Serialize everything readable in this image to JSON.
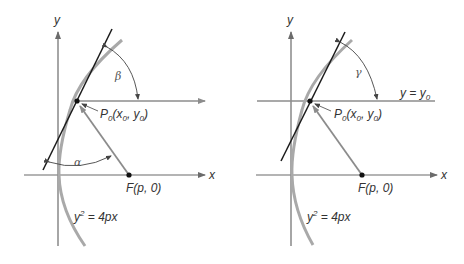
{
  "figure": {
    "left": {
      "axis_x_label": "x",
      "axis_y_label": "y",
      "point_label": {
        "P": "P",
        "sub0": "0",
        "open": "(",
        "x": "x",
        "comma": ", ",
        "y": "y",
        "close": ")"
      },
      "focus_label": {
        "F": "F",
        "open": "(",
        "p": "p",
        "rest": ", 0)"
      },
      "curve_label": {
        "y": "y",
        "exp": "2",
        "eq": " = 4",
        "p": "p",
        "x": "x"
      },
      "angle_top": "β",
      "angle_bottom": "α"
    },
    "right": {
      "axis_x_label": "x",
      "axis_y_label": "y",
      "point_label": {
        "P": "P",
        "sub0": "0",
        "open": "(",
        "x": "x",
        "comma": ", ",
        "y": "y",
        "close": ")"
      },
      "focus_label": {
        "F": "F",
        "open": "(",
        "p": "p",
        "rest": ", 0)"
      },
      "curve_label": {
        "y": "y",
        "exp": "2",
        "eq": " = 4",
        "p": "p",
        "x": "x"
      },
      "line_label": {
        "y": "y",
        "eq": " = ",
        "y0": "y",
        "sub0": "0"
      },
      "angle_top": "γ"
    },
    "colors": {
      "tangent": "#1a1a1a",
      "parabola": "#a9a9a9",
      "axes": "#6b6b6b",
      "ray": "#8c8c8c",
      "arc": "#444444",
      "point": "#111111"
    }
  }
}
